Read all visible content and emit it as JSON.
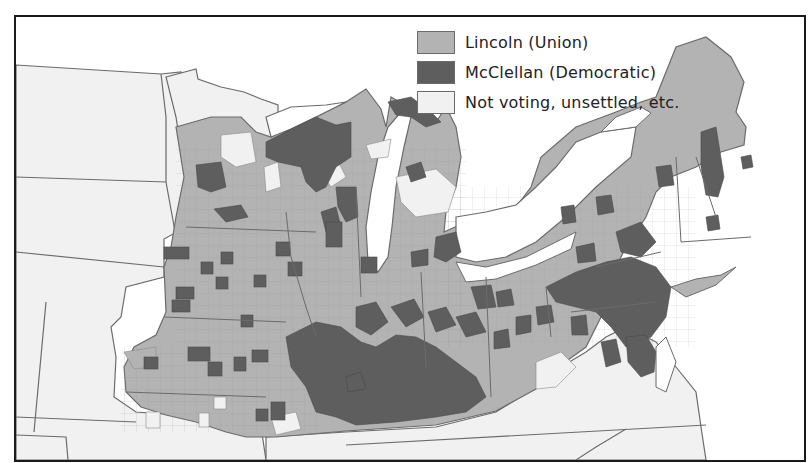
{
  "map": {
    "subject": "1864 U.S. presidential election results by county, Northern states",
    "colors": {
      "lincoln": "#b3b3b3",
      "mcclellan": "#5e5e5e",
      "not_voting": "#f1f1f1",
      "water": "#ffffff",
      "border": "#6b6b6b",
      "frame": "#1a1a1a"
    }
  },
  "legend": {
    "items": [
      {
        "key": "lincoln",
        "label": "Lincoln (Union)",
        "color": "#b3b3b3"
      },
      {
        "key": "mcclellan",
        "label": "McClellan (Democratic)",
        "color": "#5e5e5e"
      },
      {
        "key": "not_voting",
        "label": "Not voting, unsettled, etc.",
        "color": "#f1f1f1"
      }
    ]
  }
}
